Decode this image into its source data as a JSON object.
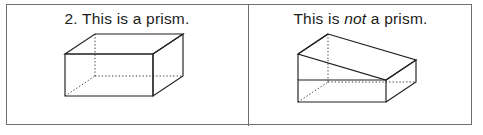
{
  "document": {
    "kind": "math-worksheet-item",
    "panel_count": 2
  },
  "panels": [
    {
      "id": "left",
      "number_label": "2.",
      "caption_prefix": "2. This is a prism.",
      "caption_parts": {
        "lead": "2. This is a prism.",
        "emphasis": "",
        "tail": ""
      },
      "figure": {
        "name": "rectangular-prism",
        "description": "rectangular prism (cuboid) drawn in oblique projection with dotted hidden edges"
      }
    },
    {
      "id": "right",
      "number_label": "",
      "caption_prefix": "This is ",
      "caption_parts": {
        "lead": "This is ",
        "emphasis": "not",
        "tail": " a prism."
      },
      "figure": {
        "name": "non-prism-wedge-solid",
        "description": "wedge/ramp solid on a rectangular base with dotted hidden edges"
      }
    }
  ],
  "style": {
    "ink_color": "#1f1f1f",
    "frame_color": "#6e6e6e",
    "hidden_edge_color": "#3a3a3a",
    "paper_color": "#ffffff"
  }
}
